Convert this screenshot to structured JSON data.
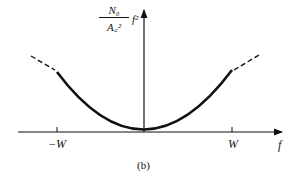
{
  "figure": {
    "y_label_numerator": "N₀",
    "y_label_denominator": "A꜀²",
    "y_label_suffix": "f²",
    "x_axis_label": "f",
    "tick_neg": "−W",
    "tick_pos": "W",
    "caption": "(b)"
  },
  "colors": {
    "ink": "#111111",
    "background": "#ffffff"
  }
}
